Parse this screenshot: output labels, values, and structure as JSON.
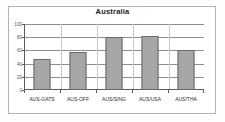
{
  "chart_data": {
    "type": "bar",
    "title": "Australia",
    "subtitle": "",
    "xlabel": "",
    "ylabel": "",
    "categories": [
      "AUS-GATS",
      "AUS-OFF",
      "AUS/SING",
      "AUS/USA",
      "AUS/THA"
    ],
    "values": [
      47,
      57,
      80,
      82,
      60
    ],
    "ylim": [
      0,
      100
    ],
    "yticks": [
      0,
      20,
      40,
      60,
      80,
      100
    ],
    "ytick_labels": [
      "0",
      "20",
      "40",
      "60",
      "80",
      "100"
    ],
    "grid": true,
    "grid_axis": "y",
    "legend": false,
    "legend_position": "none",
    "series": [
      {
        "name": "Australia",
        "values": [
          47,
          57,
          80,
          82,
          60
        ],
        "color": "#a6a6a6",
        "edge_color": "#6a6a6a"
      }
    ],
    "annotations": []
  },
  "figure": {
    "background_color": "#fdfdfd",
    "plot_background_color": "#ffffff",
    "frame_color": "#b4b4b4",
    "axis_color": "#5a5a5a",
    "grid_color": "#8d8d8d",
    "title_color": "#1c1c1c",
    "tick_label_color": "#555555",
    "category_label_color": "#2b2b2b"
  }
}
